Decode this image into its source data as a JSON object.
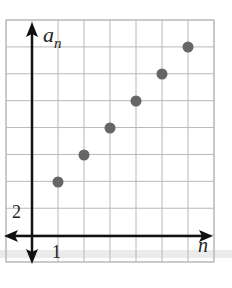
{
  "chart_data": {
    "type": "scatter",
    "title": "",
    "xlabel": "n",
    "ylabel": "a_n",
    "ylabel_main": "a",
    "ylabel_sub": "n",
    "x_tick_label": "1",
    "y_tick_label": "2",
    "x_step": 1,
    "y_step": 2,
    "xlim": [
      -1,
      7
    ],
    "ylim": [
      -2,
      16
    ],
    "grid": true,
    "legend": null,
    "points": [
      {
        "x": 1,
        "y": 4
      },
      {
        "x": 2,
        "y": 6
      },
      {
        "x": 3,
        "y": 8
      },
      {
        "x": 4,
        "y": 10
      },
      {
        "x": 5,
        "y": 12
      },
      {
        "x": 6,
        "y": 14
      }
    ],
    "x": [
      1,
      2,
      3,
      4,
      5,
      6
    ],
    "values": [
      4,
      6,
      8,
      10,
      12,
      14
    ]
  },
  "colors": {
    "grid": "#b8b8b8",
    "axis": "#111111",
    "point": "#666666",
    "band": "#e6e6e6"
  }
}
